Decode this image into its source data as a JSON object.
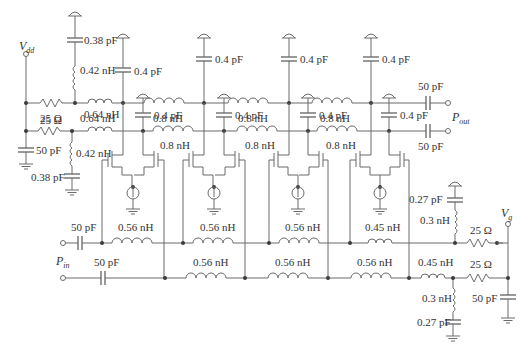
{
  "figure": {
    "type": "distributed-amplifier-schematic",
    "ports": {
      "vdd": {
        "symbol": "V",
        "sub": "dd"
      },
      "vg": {
        "symbol": "V",
        "sub": "g"
      },
      "pin": {
        "symbol": "P",
        "sub": "in"
      },
      "pout": {
        "symbol": "P",
        "sub": "out"
      }
    },
    "drain_line_top": {
      "bias_resistor": "25 Ω",
      "bias_choke": "0.42 nH",
      "bias_cap": "0.38 pF",
      "first_inductor": "0.64 nH",
      "inductors": [
        "0.8 nH",
        "0.8 nH",
        "0.8 nH"
      ],
      "shunt_caps": [
        "0.4 pF",
        "0.4 pF",
        "0.4 pF",
        "0.4 pF"
      ],
      "output_cap": "50 pF"
    },
    "drain_line_bottom": {
      "bias_resistor": "25 Ω",
      "decoupling_cap": "50 pF",
      "bias_choke": "0.42 nH",
      "bias_cap": "0.38 pF",
      "first_inductor": "0.64 nH",
      "inductors": [
        "0.8 nH",
        "0.8 nH",
        "0.8 nH"
      ],
      "shunt_caps": [
        "0.4 pF",
        "0.4 pF",
        "0.4 pF",
        "0.4 pF"
      ],
      "output_cap": "50 pF"
    },
    "gate_line_top": {
      "input_cap": "50 pF",
      "inductors": [
        "0.56 nH",
        "0.56 nH",
        "0.56 nH",
        "0.45 nH"
      ],
      "term_choke": "0.3 nH",
      "term_cap": "0.27 pF",
      "term_resistor": "25 Ω"
    },
    "gate_line_bottom": {
      "input_cap": "50 pF",
      "inductors": [
        "0.56 nH",
        "0.56 nH",
        "0.56 nH",
        "0.45 nH"
      ],
      "term_choke": "0.3 nH",
      "term_cap": "0.27 pF",
      "term_resistor": "25 Ω",
      "vg_cap": "50 pF"
    },
    "stages": 4
  }
}
